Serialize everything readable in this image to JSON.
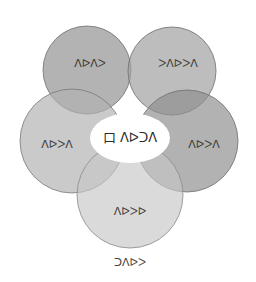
{
  "diagram": {
    "type": "flower-venn",
    "center": {
      "label": "口 ᐱᐅᑐᐱ",
      "fill": "#ffffff"
    },
    "petals": [
      {
        "id": "top-left",
        "label": "ᐱᐅᐱᐳ",
        "cx": 87,
        "cy": 70,
        "r": 44,
        "fill": "#9a9a9a"
      },
      {
        "id": "top-right",
        "label": "ᐳᐱᐅᐳᐱ",
        "cx": 172,
        "cy": 71,
        "r": 44,
        "fill": "#a3a3a3"
      },
      {
        "id": "right",
        "label": "ᐱᐅᐳᐱ",
        "cx": 187,
        "cy": 141,
        "r": 51,
        "fill": "#8e8e8e"
      },
      {
        "id": "bottom",
        "label": "ᐱᐅᐳᐅ",
        "cx": 130,
        "cy": 195,
        "r": 53,
        "fill": "#c6c6c6"
      },
      {
        "id": "left",
        "label": "ᐱᐅᐳᐱ",
        "cx": 72,
        "cy": 141,
        "r": 52,
        "fill": "#b1b1b1"
      }
    ],
    "caption": "ᑐᐱᐅᐳ",
    "stroke": "#6e6e6e"
  }
}
